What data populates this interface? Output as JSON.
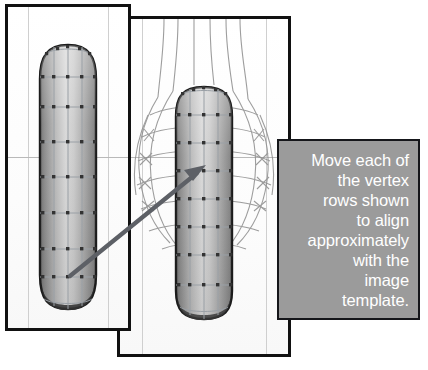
{
  "figure": {
    "background_color": "#ffffff"
  },
  "callout": {
    "text": "Move each of\nthe vertex\nrows shown\nto align\napproximately\nwith the\nimage\ntemplate.",
    "plain_text": "Move each of the vertex rows shown to align approximately with the image template.",
    "lines": [
      "Move each of",
      "the vertex",
      "rows shown",
      "to align",
      "approximately",
      "with the",
      "image",
      "template."
    ],
    "text_color": "#ffffff",
    "box_color": "#9b9b9b",
    "border_color": "#15161a",
    "text_align": "right"
  },
  "panels": [
    {
      "id": "panel-left",
      "name": "front-viewport-before",
      "border_color": "#111111",
      "background_color": "#fdfdfd",
      "guide_line_color": "#b9b9b9",
      "mesh": {
        "type": "capsule-mesh",
        "shading": "smooth-gray",
        "vertex_color": "#3a3a3a",
        "edge_color": "#9aa0a6",
        "outline_color": "#1a1a1a",
        "vertex_row_count": 9,
        "column_count": 4
      }
    },
    {
      "id": "panel-right",
      "name": "front-viewport-with-template",
      "border_color": "#111111",
      "background_color": "#fdfdfd",
      "guide_line_color": "#b9b9b9",
      "mesh": {
        "type": "capsule-mesh",
        "shading": "smooth-gray",
        "vertex_color": "#3a3a3a",
        "edge_color": "#9aa0a6",
        "outline_color": "#1a1a1a",
        "vertex_row_count": 9,
        "column_count": 4
      },
      "template_overlay": {
        "type": "wireframe-image-template",
        "color": "#8d8d8d",
        "description": "bulbous reference wireframe behind mesh"
      }
    }
  ],
  "annotation_arrow": {
    "name": "pointer-arrow",
    "color": "#5d6066",
    "from": {
      "x": 70,
      "y": 276
    },
    "to": {
      "x": 205,
      "y": 166
    },
    "head": "solid-triangle"
  }
}
